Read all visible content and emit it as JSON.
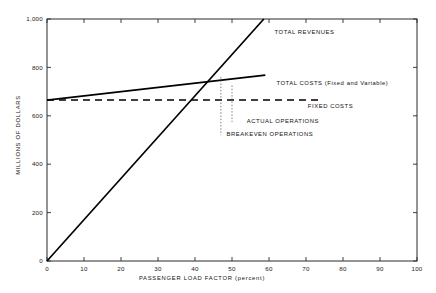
{
  "chart_data": {
    "type": "line",
    "title": "",
    "xlabel": "PASSENGER LOAD FACTOR  (percent)",
    "ylabel": "MILLIONS OF DOLLARS",
    "xlim": [
      0,
      100
    ],
    "ylim": [
      0,
      1000
    ],
    "grid": false,
    "legend_position": "inline-annotations",
    "x_ticks": [
      "0",
      "10",
      "20",
      "30",
      "40",
      "50",
      "60",
      "70",
      "80",
      "90",
      "100"
    ],
    "x_tick_values": [
      0,
      10,
      20,
      30,
      40,
      50,
      60,
      70,
      80,
      90,
      100
    ],
    "y_ticks": [
      "0",
      "200",
      "400",
      "600",
      "800",
      "1,000"
    ],
    "y_tick_values": [
      0,
      200,
      400,
      600,
      800,
      1000
    ],
    "series": [
      {
        "name": "TOTAL REVENUES",
        "style": "solid",
        "points": [
          [
            0,
            0
          ],
          [
            58.6,
            1000
          ]
        ],
        "label": "TOTAL REVENUES",
        "label_x": 61.5,
        "label_y": 945
      },
      {
        "name": "TOTAL COSTS (Fixed and Variable)",
        "style": "solid",
        "points": [
          [
            0,
            665
          ],
          [
            59.0,
            768
          ]
        ],
        "label": "TOTAL COSTS (Fixed and Variable)",
        "label_x": 62.0,
        "label_y": 735
      },
      {
        "name": "FIXED COSTS",
        "style": "dashed",
        "points": [
          [
            0,
            665
          ],
          [
            74.0,
            665
          ]
        ],
        "label": "FIXED COSTS",
        "label_x": 70.5,
        "label_y": 640
      }
    ],
    "markers": [
      {
        "name": "BREAKEVEN OPERATIONS",
        "style": "dotted-vertical",
        "x": 47.0,
        "y_top": 760,
        "y_bottom": 520,
        "label": "BREAKEVEN OPERATIONS",
        "label_x": 48.5,
        "label_y": 523
      },
      {
        "name": "ACTUAL OPERATIONS",
        "style": "dotted-vertical",
        "x": 50.0,
        "y_top": 725,
        "y_bottom": 575,
        "label": "ACTUAL OPERATIONS",
        "label_x": 54.0,
        "label_y": 578
      }
    ],
    "annotations": [
      "TOTAL REVENUES",
      "TOTAL COSTS (Fixed and Variable)",
      "FIXED COSTS",
      "ACTUAL OPERATIONS",
      "BREAKEVEN OPERATIONS"
    ],
    "colors": {
      "line": "#000000",
      "axis": "#2a2a2a",
      "text": "#111111",
      "dropline": "#555555",
      "background": "#ffffff"
    }
  }
}
